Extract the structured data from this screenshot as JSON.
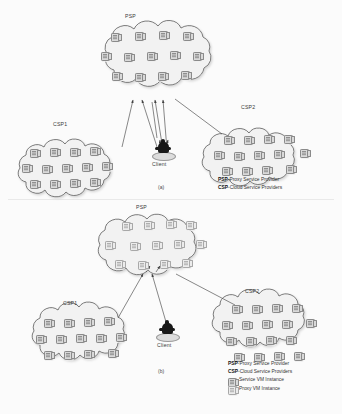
{
  "figure": {
    "panels": [
      {
        "id": "a",
        "caption": "(a)",
        "clouds": [
          {
            "name": "psp",
            "label": "PSP",
            "icon_rows": [
              4,
              5,
              4
            ],
            "icon_type": "service-vm"
          },
          {
            "name": "csp1",
            "label": "CSP1",
            "icon_rows": [
              4,
              5,
              4
            ],
            "icon_type": "service-vm"
          },
          {
            "name": "csp2",
            "label": "CSP2",
            "icon_rows": [
              4,
              5,
              4
            ],
            "icon_type": "service-vm"
          }
        ],
        "client_label": "Client",
        "legend": [
          {
            "abbr": "PSP",
            "text": "-Proxy Service Provider",
            "swatch": "none"
          },
          {
            "abbr": "CSP",
            "text": "-Cloud Service Providers",
            "swatch": "none"
          }
        ]
      },
      {
        "id": "b",
        "caption": "(b)",
        "clouds": [
          {
            "name": "psp",
            "label": "PSP",
            "icon_rows": [
              4,
              5,
              4
            ],
            "icon_type": "proxy-vm"
          },
          {
            "name": "csp1",
            "label": "CSP1",
            "icon_rows": [
              4,
              5,
              4
            ],
            "icon_type": "service-vm"
          },
          {
            "name": "csp2",
            "label": "CSP2",
            "icon_rows": [
              4,
              5,
              4
            ],
            "icon_type": "service-vm"
          }
        ],
        "client_label": "Client",
        "legend": [
          {
            "abbr": "PSP",
            "text": "-Proxy Service Provider",
            "swatch": "none"
          },
          {
            "abbr": "CSP",
            "text": "-Cloud Service Providers",
            "swatch": "none"
          },
          {
            "abbr": "",
            "text": "Service VM Instance",
            "swatch": "service-vm"
          },
          {
            "abbr": "",
            "text": "Proxy VM Instance",
            "swatch": "proxy-vm"
          }
        ]
      }
    ],
    "colors": {
      "background": "#fbfbfb",
      "cloud_fill": "#f2f2f2",
      "cloud_stroke": "#555555",
      "vm_fill": "#d9d9d9",
      "vm_stroke": "#8a8a8a",
      "proxy_vm_fill": "#ececec",
      "arrow_stroke": "#4a4a4a",
      "client_silhouette": "#181818",
      "text": "#333333"
    }
  }
}
